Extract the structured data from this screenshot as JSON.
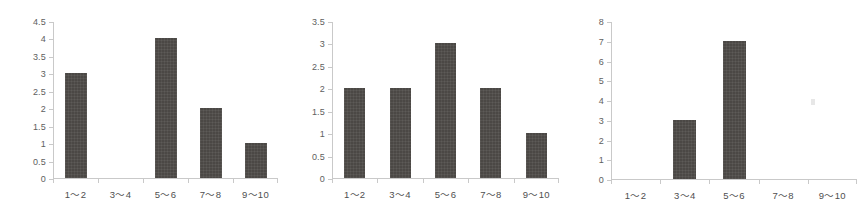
{
  "background_color": "#ffffff",
  "bar_color": "#4b4845",
  "axis_color": "#c9c9c9",
  "label_color": "#4f4f4f",
  "artifact": {
    "name": "scan-speck",
    "color": "#e3e3e3"
  },
  "chart_data": [
    {
      "type": "bar",
      "title": "",
      "xlabel": "",
      "ylabel": "",
      "categories": [
        "1～2",
        "3～4",
        "5～6",
        "7～8",
        "9～10"
      ],
      "values": [
        3,
        0,
        4,
        2,
        1
      ],
      "ylim": [
        0,
        4.5
      ],
      "yticks": [
        0,
        0.5,
        1,
        1.5,
        2,
        2.5,
        3,
        3.5,
        4,
        4.5
      ],
      "ytick_labels": [
        "0",
        "0.5",
        "1",
        "1.5",
        "2",
        "2.5",
        "3",
        "3.5",
        "4",
        "4.5"
      ],
      "grid": false,
      "legend": false
    },
    {
      "type": "bar",
      "title": "",
      "xlabel": "",
      "ylabel": "",
      "categories": [
        "1～2",
        "3～4",
        "5～6",
        "7～8",
        "9～10"
      ],
      "values": [
        2,
        2,
        3,
        2,
        1
      ],
      "ylim": [
        0,
        3.5
      ],
      "yticks": [
        0,
        0.5,
        1,
        1.5,
        2,
        2.5,
        3,
        3.5
      ],
      "ytick_labels": [
        "0",
        "0.5",
        "1",
        "1.5",
        "2",
        "2.5",
        "3",
        "3.5"
      ],
      "grid": false,
      "legend": false
    },
    {
      "type": "bar",
      "title": "",
      "xlabel": "",
      "ylabel": "",
      "categories": [
        "1～2",
        "3～4",
        "5～6",
        "7～8",
        "9～10"
      ],
      "values": [
        0,
        3,
        7,
        0,
        0
      ],
      "ylim": [
        0,
        8
      ],
      "yticks": [
        0,
        1,
        2,
        3,
        4,
        5,
        6,
        7,
        8
      ],
      "ytick_labels": [
        "0",
        "1",
        "2",
        "3",
        "4",
        "5",
        "6",
        "7",
        "8"
      ],
      "grid": false,
      "legend": false
    }
  ]
}
